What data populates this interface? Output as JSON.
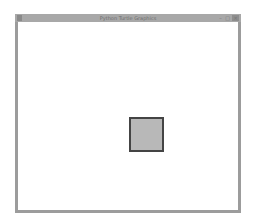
{
  "window": {
    "title": "Python Turtle Graphics",
    "controls": {
      "minimize": "–",
      "maximize": "□",
      "close": "✕"
    },
    "icon": "feather-icon"
  },
  "canvas": {
    "background": "#ffffff",
    "shapes": [
      {
        "type": "square",
        "fill": "#b8b8b8",
        "stroke": "#444444"
      }
    ]
  }
}
